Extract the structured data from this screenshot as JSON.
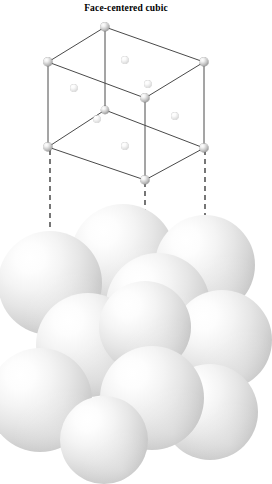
{
  "figure": {
    "title": "Face-centered cubic",
    "type": "crystal-lattice-illustration",
    "colors": {
      "background": "#ffffff",
      "line": "#4a4a4a",
      "dashed_line": "#3c3c3c",
      "corner_atom": "#9a9a9a",
      "face_atom": "#e0e0e0",
      "sphere_light": "#ffffff",
      "sphere_dark": "#9a9a9a"
    },
    "unit_cell": {
      "label": "unit cell wireframe",
      "corner_atoms": [
        {
          "name": "corner-top-back",
          "x": 105,
          "y": 27,
          "r": 4.6
        },
        {
          "name": "corner-top-left",
          "x": 48,
          "y": 62,
          "r": 4.6
        },
        {
          "name": "corner-top-right",
          "x": 204,
          "y": 62,
          "r": 4.6
        },
        {
          "name": "corner-top-front",
          "x": 145,
          "y": 98,
          "r": 4.6
        },
        {
          "name": "corner-bottom-back",
          "x": 105,
          "y": 110,
          "r": 4.0
        },
        {
          "name": "corner-bottom-left",
          "x": 48,
          "y": 147,
          "r": 4.6
        },
        {
          "name": "corner-bottom-right",
          "x": 204,
          "y": 148,
          "r": 4.6
        },
        {
          "name": "corner-bottom-front",
          "x": 145,
          "y": 180,
          "r": 4.6
        }
      ],
      "face_atoms": [
        {
          "name": "face-top",
          "x": 125,
          "y": 60,
          "r": 3.6
        },
        {
          "name": "face-back-right",
          "x": 148,
          "y": 84,
          "r": 3.6
        },
        {
          "name": "face-left",
          "x": 74,
          "y": 88,
          "r": 3.6
        },
        {
          "name": "face-front-left",
          "x": 97,
          "y": 119,
          "r": 3.6
        },
        {
          "name": "face-right",
          "x": 175,
          "y": 116,
          "r": 3.6
        },
        {
          "name": "face-bottom",
          "x": 125,
          "y": 146,
          "r": 3.6
        }
      ],
      "edges": [
        {
          "x1": 105,
          "y1": 27,
          "x2": 48,
          "y2": 62
        },
        {
          "x1": 105,
          "y1": 27,
          "x2": 204,
          "y2": 62
        },
        {
          "x1": 48,
          "y1": 62,
          "x2": 145,
          "y2": 98
        },
        {
          "x1": 204,
          "y1": 62,
          "x2": 145,
          "y2": 98
        },
        {
          "x1": 105,
          "y1": 27,
          "x2": 105,
          "y2": 110
        },
        {
          "x1": 48,
          "y1": 62,
          "x2": 48,
          "y2": 147
        },
        {
          "x1": 204,
          "y1": 62,
          "x2": 204,
          "y2": 148
        },
        {
          "x1": 145,
          "y1": 98,
          "x2": 145,
          "y2": 180
        },
        {
          "x1": 105,
          "y1": 110,
          "x2": 48,
          "y2": 147
        },
        {
          "x1": 105,
          "y1": 110,
          "x2": 204,
          "y2": 148
        },
        {
          "x1": 48,
          "y1": 147,
          "x2": 145,
          "y2": 180
        },
        {
          "x1": 204,
          "y1": 148,
          "x2": 145,
          "y2": 180
        }
      ]
    },
    "guide_lines": [
      {
        "name": "guide-left",
        "x": 50,
        "y1": 150,
        "y2": 285
      },
      {
        "name": "guide-middle",
        "x": 145,
        "y1": 182,
        "y2": 327
      },
      {
        "name": "guide-right",
        "x": 205,
        "y1": 150,
        "y2": 266
      }
    ],
    "sphere_cluster": {
      "label": "close-packed atom arrangement",
      "spheres": [
        {
          "name": "sphere-back-top",
          "x": 123,
          "y": 256,
          "r": 52,
          "z": 1
        },
        {
          "name": "sphere-back-right",
          "x": 205,
          "y": 265,
          "r": 50,
          "z": 2
        },
        {
          "name": "sphere-mid-center",
          "x": 158,
          "y": 305,
          "r": 52,
          "z": 3
        },
        {
          "name": "sphere-left-upper",
          "x": 50,
          "y": 283,
          "r": 52,
          "z": 4
        },
        {
          "name": "sphere-right-lower",
          "x": 222,
          "y": 340,
          "r": 50,
          "z": 5
        },
        {
          "name": "sphere-mid-left",
          "x": 88,
          "y": 345,
          "r": 52,
          "z": 6
        },
        {
          "name": "sphere-front-center",
          "x": 145,
          "y": 327,
          "r": 46,
          "z": 7
        },
        {
          "name": "sphere-bottom-left",
          "x": 40,
          "y": 400,
          "r": 52,
          "z": 8
        },
        {
          "name": "sphere-bottom-right",
          "x": 210,
          "y": 412,
          "r": 48,
          "z": 9
        },
        {
          "name": "sphere-front-lower",
          "x": 152,
          "y": 398,
          "r": 52,
          "z": 10
        },
        {
          "name": "sphere-bottom-mid",
          "x": 104,
          "y": 440,
          "r": 44,
          "z": 11
        }
      ]
    }
  }
}
